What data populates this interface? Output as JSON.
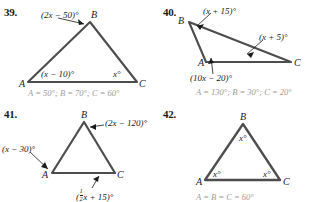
{
  "page": {
    "background": "#ffffff",
    "ink": "#1a1a1a",
    "answer_color": "#9a9a9a",
    "stroke_color": "#4d4d4d"
  },
  "problems": [
    {
      "number": "39.",
      "vertices": {
        "A": "A",
        "B": "B",
        "C": "C"
      },
      "angle_labels": [
        {
          "name": "angle-b-expression",
          "text": "(2x − 50)°"
        },
        {
          "name": "angle-a-expression",
          "text": "(x − 10)°"
        },
        {
          "name": "angle-c-expression",
          "text": "x°"
        }
      ],
      "answer": "A = 50°; B = 70°; C = 60°"
    },
    {
      "number": "40.",
      "vertices": {
        "A": "A",
        "B": "B",
        "C": "C"
      },
      "angle_labels": [
        {
          "name": "angle-b-expression",
          "text": "(x + 15)°"
        },
        {
          "name": "angle-c-expression",
          "text": "(x + 5)°"
        },
        {
          "name": "angle-a-expression",
          "text": "(10x − 20)°"
        }
      ],
      "answer": "A = 130°; B = 30°; C = 20°"
    },
    {
      "number": "41.",
      "vertices": {
        "A": "A",
        "B": "B",
        "C": "C"
      },
      "angle_labels": [
        {
          "name": "angle-b-expression",
          "text": "(2x − 120)°"
        },
        {
          "name": "angle-a-expression",
          "text": "(x − 30)°"
        }
      ],
      "angle_c_fraction": {
        "open": "(",
        "numerator": "1",
        "denominator": "2",
        "rest": "x + 15)°"
      },
      "answer": ""
    },
    {
      "number": "42.",
      "vertices": {
        "A": "A",
        "B": "B",
        "C": "C"
      },
      "angle_labels": [
        {
          "name": "angle-b-expression",
          "text": "x°"
        },
        {
          "name": "angle-a-expression",
          "text": "x°"
        },
        {
          "name": "angle-c-expression",
          "text": "x°"
        }
      ],
      "answer": "A = B = C = 60°"
    }
  ]
}
